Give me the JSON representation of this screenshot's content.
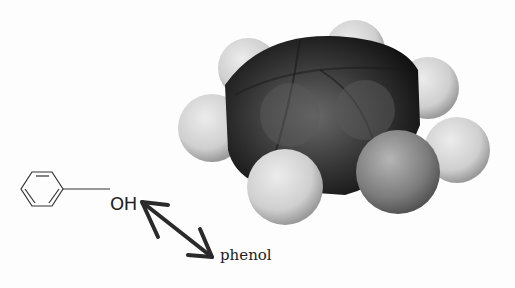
{
  "structure": {
    "ring": "benzene",
    "substituent_label": "OH"
  },
  "label": {
    "compound_name": "phenol"
  },
  "model": {
    "type": "space-filling",
    "atoms": [
      {
        "element": "C",
        "count": 6,
        "color": "#2a2a2a"
      },
      {
        "element": "H",
        "count": 6,
        "color": "#d6d6d6"
      },
      {
        "element": "O",
        "count": 1,
        "color": "#8a8a8a"
      }
    ]
  },
  "arrow": {
    "style": "double-headed",
    "color": "#2a2a2a"
  }
}
